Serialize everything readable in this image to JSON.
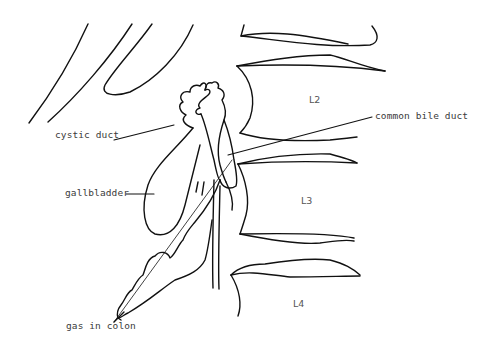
{
  "diagram": {
    "type": "anatomical line drawing",
    "colors": {
      "stroke": "#111111",
      "label_text": "#3a3a3a",
      "background": "#ffffff"
    },
    "labels": {
      "cystic_duct": "cystic duct",
      "common_bile_duct": "common bile duct",
      "gallbladder": "gallbladder",
      "gas_in_colon": "gas in colon"
    },
    "vertebrae": {
      "l2": "L2",
      "l3": "L3",
      "l4": "L4"
    }
  }
}
